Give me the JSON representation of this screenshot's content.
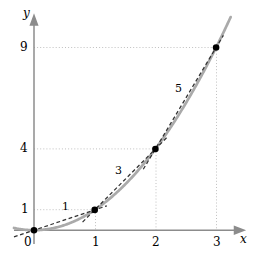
{
  "chart_data": {
    "type": "line",
    "title": "",
    "xlabel": "x",
    "ylabel": "y",
    "xlim": [
      -0.33,
      3.45
    ],
    "ylim": [
      -0.45,
      10.6
    ],
    "grid": "dotted-gridlines-to-marked-points",
    "legend": "none",
    "series": [
      {
        "name": "y = x^2",
        "style": "solid",
        "color": "#aaaaaa",
        "x": [
          -0.33,
          -0.2,
          0,
          0.25,
          0.5,
          0.75,
          1,
          1.25,
          1.5,
          1.75,
          2,
          2.25,
          2.5,
          2.75,
          3,
          3.2
        ],
        "values": [
          0.109,
          0.04,
          0,
          0.0625,
          0.25,
          0.5625,
          1,
          1.5625,
          2.25,
          3.0625,
          4,
          5.0625,
          6.25,
          7.5625,
          9,
          10.24
        ]
      },
      {
        "name": "secant 0 to 1",
        "style": "dashed",
        "color": "#333333",
        "x": [
          -0.33,
          0,
          1,
          1.2
        ],
        "values": [
          -0.33,
          0,
          1,
          1.2
        ],
        "slope": 1
      },
      {
        "name": "secant 1 to 2",
        "style": "dashed",
        "color": "#333333",
        "x": [
          0.8,
          1,
          2,
          2.2
        ],
        "values": [
          0.4,
          1,
          4,
          4.6
        ],
        "slope": 3
      },
      {
        "name": "secant 2 to 3",
        "style": "dashed",
        "color": "#333333",
        "x": [
          1.8,
          2,
          3,
          3.12
        ],
        "values": [
          3.0,
          4,
          9,
          9.6
        ],
        "slope": 5
      }
    ],
    "points": [
      {
        "label": "origin",
        "x": 0,
        "y": 0
      },
      {
        "label": "p1",
        "x": 1,
        "y": 1
      },
      {
        "label": "p2",
        "x": 2,
        "y": 4
      },
      {
        "label": "p3",
        "x": 3,
        "y": 9
      }
    ],
    "x_ticks": [
      {
        "value": 0,
        "label": "0"
      },
      {
        "value": 1,
        "label": "1"
      },
      {
        "value": 2,
        "label": "2"
      },
      {
        "value": 3,
        "label": "3"
      }
    ],
    "y_ticks": [
      {
        "value": 1,
        "label": "1"
      },
      {
        "value": 4,
        "label": "4"
      },
      {
        "value": 9,
        "label": "9"
      }
    ],
    "annotations": [
      {
        "text": "1",
        "x": 0.5,
        "y": 1.05,
        "meaning": "slope of secant from x=0 to x=1"
      },
      {
        "text": "3",
        "x": 1.38,
        "y": 3.0,
        "meaning": "slope of secant from x=1 to x=2"
      },
      {
        "text": "5",
        "x": 2.37,
        "y": 7.05,
        "meaning": "slope of secant from x=2 to x=3"
      }
    ],
    "colors": {
      "curve": "#aaaaaa",
      "secant": "#333333",
      "axis": "#8c8c8c",
      "gridline": "#bbbbbb",
      "point": "#000000",
      "text": "#000000",
      "background": "#ffffff"
    }
  },
  "axes": {
    "x_axis_name": "x",
    "y_axis_name": "y"
  }
}
